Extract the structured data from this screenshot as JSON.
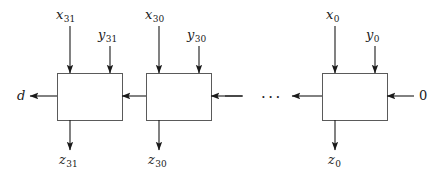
{
  "figure": {
    "kind": "ripple-borrow-subtractor-chain",
    "stroke_color": "#404040",
    "text_color": "#1a1a1a",
    "background": "#ffffff",
    "ellipsis": "···"
  },
  "cells": [
    {
      "id": "cell-31",
      "x_label": "x",
      "x_sub": "31",
      "y_label": "y",
      "y_sub": "31",
      "z_label": "z",
      "z_sub": "31"
    },
    {
      "id": "cell-30",
      "x_label": "x",
      "x_sub": "30",
      "y_label": "y",
      "y_sub": "30",
      "z_label": "z",
      "z_sub": "30"
    },
    {
      "id": "cell-0",
      "x_label": "x",
      "x_sub": "0",
      "y_label": "y",
      "y_sub": "0",
      "z_label": "z",
      "z_sub": "0"
    }
  ],
  "terminals": {
    "borrow_out_label": "d",
    "borrow_in_label": "0"
  }
}
